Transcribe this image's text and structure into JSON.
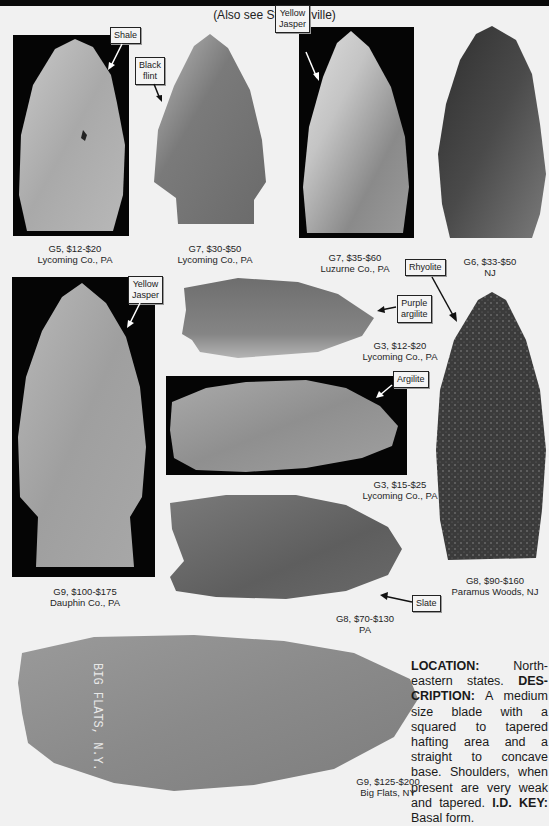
{
  "header": {
    "subtitle": "(Also see Steubenville)"
  },
  "points": [
    {
      "id": "p1",
      "grade_price": "G5, $12-$20",
      "location": "Lycoming Co., PA",
      "material": "Shale"
    },
    {
      "id": "p2",
      "grade_price": "G7, $30-$50",
      "location": "Lycoming Co., PA",
      "material": "Black flint",
      "material_lines": [
        "Black",
        "flint"
      ]
    },
    {
      "id": "p3",
      "grade_price": "G7, $35-$60",
      "location": "Luzurne Co., PA",
      "material": "Yellow Jasper",
      "material_lines": [
        "Yellow",
        "Jasper"
      ]
    },
    {
      "id": "p4",
      "grade_price": "G6, $33-$50",
      "location": "NJ"
    },
    {
      "id": "p5",
      "grade_price": "G9, $100-$175",
      "location": "Dauphin Co., PA",
      "material": "Yellow Jasper",
      "material_lines": [
        "Yellow",
        "Jasper"
      ]
    },
    {
      "id": "p6",
      "grade_price": "G3, $12-$20",
      "location": "Lycoming Co., PA",
      "material": "Purple argilite",
      "material_lines": [
        "Purple",
        "argilite"
      ]
    },
    {
      "id": "p7",
      "grade_price": "G3, $15-$25",
      "location": "Lycoming Co., PA",
      "material": "Argilite"
    },
    {
      "id": "p8",
      "grade_price": "G8, $90-$160",
      "location": "Paramus Woods, NJ",
      "material": "Rhyolite"
    },
    {
      "id": "p9",
      "grade_price": "G8, $70-$130",
      "location": "PA",
      "material": "Slate"
    },
    {
      "id": "p10",
      "grade_price": "G9, $125-$200",
      "location": "Big Flats, NY",
      "inscription": "BIG FLATS, N.Y."
    }
  ],
  "description": {
    "location_label": "LOCATION:",
    "location_text": " North-eastern states. ",
    "description_label": "DES-CRIPTION:",
    "description_text": " A medium size blade with a squared to tapered hafting area and a straight to concave base. Shoulders, when present are very weak and tapered. ",
    "idkey_label": "I.D. KEY:",
    "idkey_text": " Basal form."
  },
  "colors": {
    "page_bg": "#f1f1f1",
    "photo_bg": "#050505",
    "label_border": "#222222"
  }
}
